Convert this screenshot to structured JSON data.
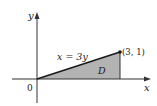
{
  "figure": {
    "axes": {
      "x_label": "x",
      "y_label": "y",
      "origin_label": "0"
    },
    "curve": {
      "equation_label": "x = 3y"
    },
    "point": {
      "label": "(3, 1)",
      "x": 3,
      "y": 1
    },
    "region": {
      "label": "D",
      "vertices": [
        [
          0,
          0
        ],
        [
          3,
          1
        ],
        [
          3,
          0
        ]
      ],
      "fill_color": "#b3b3b3"
    },
    "colors": {
      "line": "#1a1a1a",
      "axis": "#333333",
      "background": "#ffffff"
    }
  }
}
